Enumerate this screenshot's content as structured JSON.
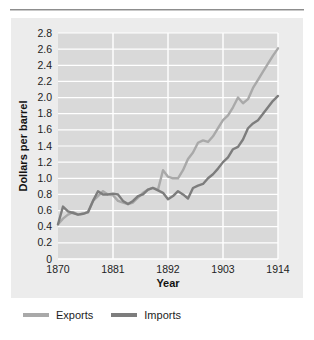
{
  "figure": {
    "title_partial": "",
    "background_color": "#ffffff",
    "panel_color": "#ececec",
    "plot_color": "#d9d9d9",
    "grid_color": "#ffffff"
  },
  "axes": {
    "ylabel": "Dollars per barrel",
    "xlabel": "Year",
    "yticks": [
      "2.8",
      "2.6",
      "2.4",
      "2.2",
      "2.0",
      "1.8",
      "1.6",
      "1.4",
      "1.2",
      "1.0",
      "0.8",
      "0.6",
      "0.4",
      "0.2",
      "0"
    ],
    "xticks": [
      "1870",
      "1881",
      "1892",
      "1903",
      "1914"
    ]
  },
  "legend": {
    "items": [
      {
        "label": "Exports",
        "color": "#a9a9a9"
      },
      {
        "label": "Imports",
        "color": "#7d7d7d"
      }
    ]
  },
  "chart_data": {
    "type": "line",
    "title": "",
    "xlabel": "Year",
    "ylabel": "Dollars per barrel",
    "xlim": [
      1870,
      1914
    ],
    "ylim": [
      0,
      2.8
    ],
    "ytick_step": 0.2,
    "grid": true,
    "legend_position": "below",
    "x": [
      1870,
      1871,
      1872,
      1873,
      1874,
      1875,
      1876,
      1877,
      1878,
      1879,
      1880,
      1881,
      1882,
      1883,
      1884,
      1885,
      1886,
      1887,
      1888,
      1889,
      1890,
      1891,
      1892,
      1893,
      1894,
      1895,
      1896,
      1897,
      1898,
      1899,
      1900,
      1901,
      1902,
      1903,
      1904,
      1905,
      1906,
      1907,
      1908,
      1909,
      1910,
      1911,
      1912,
      1913,
      1914
    ],
    "series": [
      {
        "name": "Exports",
        "color": "#a9a9a9",
        "values": [
          0.43,
          0.5,
          0.55,
          0.58,
          0.55,
          0.56,
          0.58,
          0.72,
          0.78,
          0.84,
          0.8,
          0.79,
          0.72,
          0.7,
          0.68,
          0.7,
          0.76,
          0.82,
          0.86,
          0.88,
          0.86,
          1.1,
          1.02,
          1.0,
          1.0,
          1.1,
          1.24,
          1.32,
          1.44,
          1.47,
          1.45,
          1.52,
          1.62,
          1.72,
          1.78,
          1.88,
          2.0,
          1.93,
          1.98,
          2.12,
          2.22,
          2.32,
          2.42,
          2.52,
          2.61
        ]
      },
      {
        "name": "Imports",
        "color": "#7d7d7d",
        "values": [
          0.43,
          0.65,
          0.59,
          0.57,
          0.55,
          0.56,
          0.58,
          0.72,
          0.84,
          0.8,
          0.8,
          0.81,
          0.8,
          0.72,
          0.68,
          0.72,
          0.78,
          0.8,
          0.86,
          0.88,
          0.85,
          0.82,
          0.74,
          0.78,
          0.84,
          0.8,
          0.75,
          0.88,
          0.91,
          0.93,
          1.0,
          1.05,
          1.12,
          1.2,
          1.26,
          1.36,
          1.39,
          1.48,
          1.62,
          1.68,
          1.72,
          1.8,
          1.88,
          1.96,
          2.02
        ]
      }
    ]
  }
}
